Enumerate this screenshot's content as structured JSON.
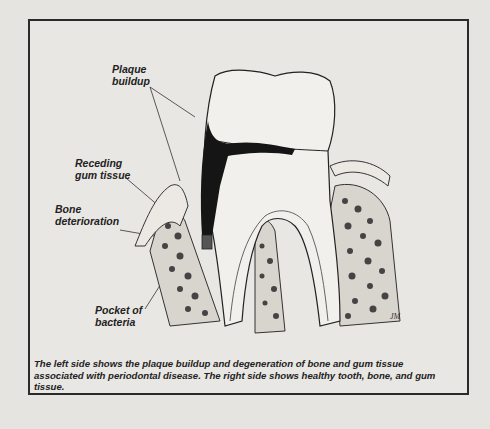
{
  "figure": {
    "labels": {
      "plaque": [
        "Plaque",
        "buildup"
      ],
      "gum": [
        "Receding",
        "gum tissue"
      ],
      "bone": [
        "Bone",
        "deterioration"
      ],
      "pocket": [
        "Pocket of",
        "bacteria"
      ]
    },
    "artist_mark": "JM"
  },
  "caption": "The left side shows the plaque buildup and degeneration of bone and gum tissue associated with periodontal disease. The right side shows healthy tooth, bone, and gum tissue."
}
